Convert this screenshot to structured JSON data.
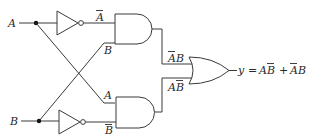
{
  "diagram": {
    "type": "logic-circuit",
    "inputs": [
      {
        "name": "A",
        "label": "A"
      },
      {
        "name": "B",
        "label": "B"
      }
    ],
    "gates": [
      {
        "id": "inv_a",
        "type": "NOT",
        "input": "A",
        "output_label": "A",
        "output_overbar": true
      },
      {
        "id": "inv_b",
        "type": "NOT",
        "input": "B",
        "output_label": "B",
        "output_overbar": true
      },
      {
        "id": "and_top",
        "type": "AND",
        "inputs": [
          "A-bar",
          "B"
        ],
        "input_labels": [
          "A",
          "B"
        ],
        "output_label": "AB",
        "output_overbar_on": "A"
      },
      {
        "id": "and_bottom",
        "type": "AND",
        "inputs": [
          "A",
          "B-bar"
        ],
        "input_labels": [
          "A",
          "B"
        ],
        "output_label": "AB",
        "output_overbar_on": "B"
      },
      {
        "id": "or_out",
        "type": "OR",
        "inputs": [
          "A-bar B",
          "A B-bar"
        ]
      }
    ],
    "labels": {
      "input_a": "A",
      "input_b": "B",
      "inv_a_out": "A",
      "and_top_in_b": "B",
      "and_bottom_in_a": "A",
      "inv_b_out": "B",
      "and_top_out_a": "A",
      "and_top_out_b": "B",
      "and_bottom_out_a": "A",
      "and_bottom_out_b": "B",
      "output_y": "y",
      "output_eq": "=",
      "term1_a": "A",
      "term1_b": "B",
      "plus": "+",
      "term2_a": "A",
      "term2_b": "B"
    },
    "output_expression": "y = AB̄ + ĀB",
    "colors": {
      "line": "#3a3a3a",
      "text": "#2a2a2a",
      "background": "#ffffff"
    }
  }
}
